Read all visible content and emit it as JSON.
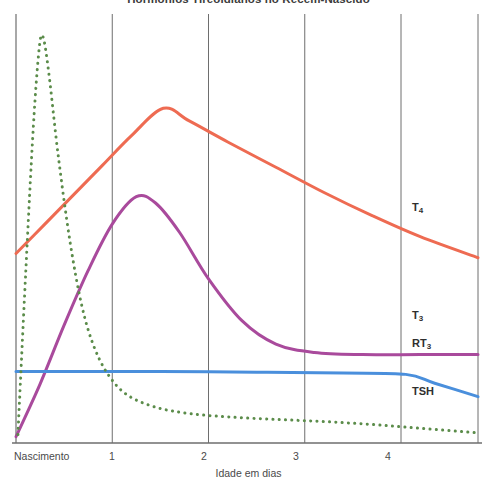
{
  "chart_data": {
    "type": "line",
    "title": "Hormônios Tireoidianos no Recém-Nascido",
    "xlabel": "Idade em dias",
    "ylabel": "",
    "xlim": [
      0,
      4.8
    ],
    "ylim": [
      0,
      100
    ],
    "grid": "vertical",
    "legend_position": "inline-right",
    "xticks": [
      {
        "value": 0,
        "label": "Nascimento"
      },
      {
        "value": 1,
        "label": "1"
      },
      {
        "value": 2,
        "label": "2"
      },
      {
        "value": 3,
        "label": "3"
      },
      {
        "value": 4,
        "label": "4"
      }
    ],
    "yticks": [],
    "series": [
      {
        "name": "T4",
        "label": "T",
        "label_sub": "4",
        "color": "#EE6B52",
        "style": "solid",
        "width": 3,
        "points": [
          [
            0.0,
            45.0
          ],
          [
            0.3,
            52.0
          ],
          [
            0.6,
            59.0
          ],
          [
            0.9,
            66.0
          ],
          [
            1.2,
            73.0
          ],
          [
            1.53,
            79.5
          ],
          [
            1.8,
            76.5
          ],
          [
            2.2,
            71.5
          ],
          [
            2.7,
            65.5
          ],
          [
            3.2,
            59.5
          ],
          [
            3.7,
            54.0
          ],
          [
            4.2,
            49.0
          ],
          [
            4.8,
            44.0
          ]
        ]
      },
      {
        "name": "T3",
        "label": "T",
        "label_sub": "3",
        "color": "#A94A9C",
        "style": "solid",
        "width": 3,
        "points": [
          [
            0.0,
            1.5
          ],
          [
            0.25,
            14.0
          ],
          [
            0.5,
            28.0
          ],
          [
            0.75,
            41.0
          ],
          [
            1.0,
            52.0
          ],
          [
            1.25,
            58.5
          ],
          [
            1.45,
            57.0
          ],
          [
            1.7,
            50.0
          ],
          [
            2.0,
            39.0
          ],
          [
            2.35,
            29.0
          ],
          [
            2.7,
            23.5
          ],
          [
            3.1,
            21.5
          ],
          [
            3.6,
            21.0
          ],
          [
            4.2,
            21.0
          ],
          [
            4.8,
            21.0
          ]
        ]
      },
      {
        "name": "RT3",
        "label": "RT",
        "label_sub": "3",
        "color": "#4A8FDC",
        "style": "solid",
        "width": 3,
        "points": [
          [
            0.0,
            17.0
          ],
          [
            0.6,
            17.0
          ],
          [
            1.5,
            17.0
          ],
          [
            2.5,
            16.8
          ],
          [
            3.4,
            16.6
          ],
          [
            4.05,
            16.3
          ],
          [
            4.35,
            14.2
          ],
          [
            4.8,
            11.0
          ]
        ]
      },
      {
        "name": "TSH",
        "label": "TSH",
        "label_sub": "",
        "color": "#5B8C4A",
        "style": "dotted",
        "width": 3,
        "points": [
          [
            0.02,
            2.0
          ],
          [
            0.1,
            40.0
          ],
          [
            0.18,
            75.0
          ],
          [
            0.24,
            93.5
          ],
          [
            0.28,
            96.5
          ],
          [
            0.34,
            88.0
          ],
          [
            0.44,
            68.0
          ],
          [
            0.56,
            48.0
          ],
          [
            0.68,
            33.0
          ],
          [
            0.8,
            23.5
          ],
          [
            0.95,
            16.5
          ],
          [
            1.15,
            11.5
          ],
          [
            1.45,
            8.5
          ],
          [
            1.8,
            7.0
          ],
          [
            2.2,
            6.2
          ],
          [
            2.7,
            5.6
          ],
          [
            3.2,
            5.1
          ],
          [
            3.7,
            4.4
          ],
          [
            4.2,
            3.5
          ],
          [
            4.8,
            2.4
          ]
        ]
      }
    ]
  },
  "axis": {
    "origin_label": "Nascimento",
    "tick_1": "1",
    "tick_2": "2",
    "tick_3": "3",
    "tick_4": "4",
    "x_title": "Idade em dias"
  },
  "labels": {
    "t4": "T",
    "t4_sub": "4",
    "t3": "T",
    "t3_sub": "3",
    "rt3": "RT",
    "rt3_sub": "3",
    "tsh": "TSH"
  },
  "colors": {
    "t4": "#EE6B52",
    "t3": "#A94A9C",
    "rt3": "#4A8FDC",
    "tsh": "#5B8C4A",
    "axis": "#6e6e6e",
    "grid": "#6e6e6e",
    "text": "#4a4a4a"
  }
}
